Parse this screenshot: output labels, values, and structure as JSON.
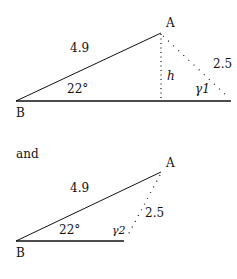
{
  "diagram1": {
    "vertex_a": "A",
    "vertex_b": "B",
    "side_ab": "4.9",
    "side_dotted": "2.5",
    "height_label": "h",
    "angle_b": "22°",
    "gamma_label": "γ1"
  },
  "connector_text": "and",
  "diagram2": {
    "vertex_a": "A",
    "vertex_b": "B",
    "side_ab": "4.9",
    "side_dotted": "2.5",
    "angle_b": "22°",
    "gamma_label": "γ2"
  },
  "colors": {
    "stroke": "#111111",
    "background": "#ffffff"
  }
}
